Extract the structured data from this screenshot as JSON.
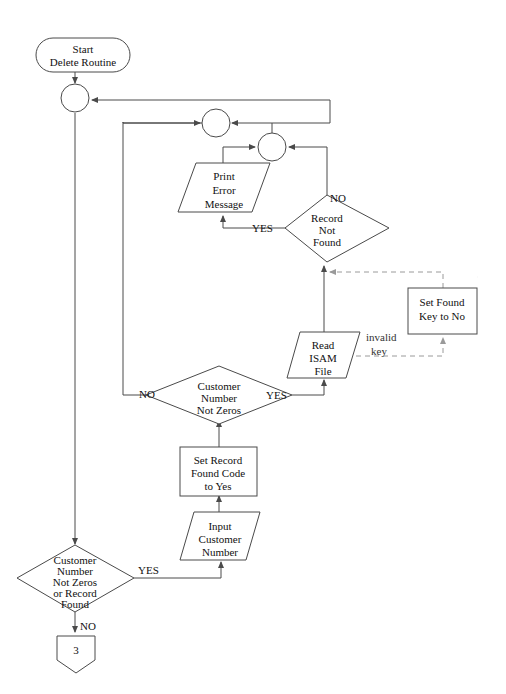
{
  "diagram": {
    "colors": {
      "stroke": "#4a4a4a",
      "dashed_stroke": "#9a9a9a",
      "text": "#111111",
      "background": "#ffffff"
    },
    "nodes": {
      "start_terminal": {
        "shape": "terminator",
        "lines": [
          "Start",
          "Delete Routine"
        ]
      },
      "connector_a": {
        "shape": "circle",
        "label": ""
      },
      "connector_b": {
        "shape": "circle",
        "label": ""
      },
      "connector_c": {
        "shape": "circle",
        "label": ""
      },
      "print_error": {
        "shape": "parallelogram",
        "lines": [
          "Print",
          "Error",
          "Message"
        ]
      },
      "record_not_found": {
        "shape": "diamond",
        "lines": [
          "Record",
          "Not",
          "Found"
        ]
      },
      "set_found_key": {
        "shape": "process",
        "lines": [
          "Set Found",
          "Key to No"
        ]
      },
      "read_isam": {
        "shape": "parallelogram",
        "lines": [
          "Read",
          "ISAM",
          "File"
        ]
      },
      "customer_number_not_zeros": {
        "shape": "diamond",
        "lines": [
          "Customer",
          "Number",
          "Not Zeros"
        ]
      },
      "set_record_found_code": {
        "shape": "process",
        "lines": [
          "Set Record",
          "Found Code",
          "to Yes"
        ]
      },
      "input_customer_number": {
        "shape": "parallelogram",
        "lines": [
          "Input",
          "Customer",
          "Number"
        ]
      },
      "loop_decision": {
        "shape": "diamond",
        "lines": [
          "Customer",
          "Number",
          "Not Zeros",
          "or Record",
          "Found"
        ]
      },
      "offpage_connector": {
        "shape": "offpage",
        "label": "3"
      }
    },
    "edge_labels": {
      "record_not_found_no": "NO",
      "record_not_found_yes": "YES",
      "invalid_key": [
        "invalid",
        "key"
      ],
      "cust_not_zeros_no": "NO",
      "cust_not_zeros_yes": "YES",
      "loop_yes": "YES",
      "loop_no": "NO"
    }
  }
}
